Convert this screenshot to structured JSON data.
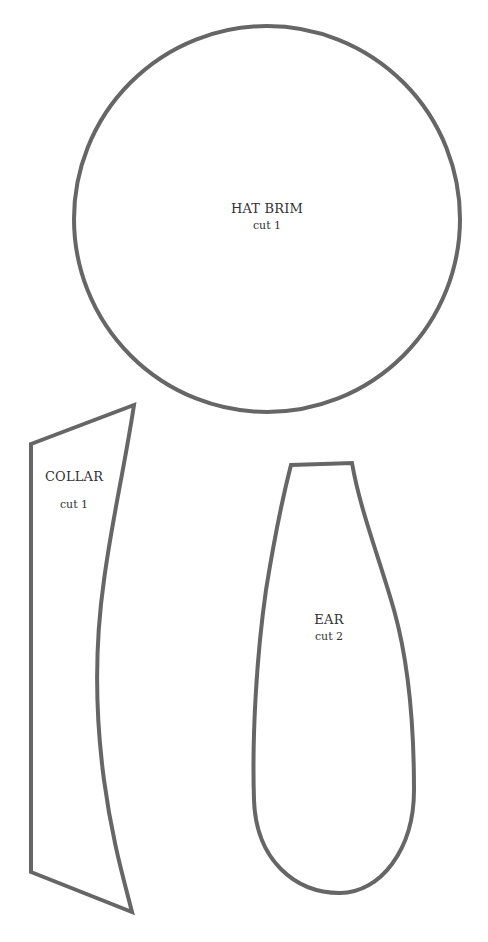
{
  "page": {
    "background": "#ffffff",
    "stroke_color": "#666666"
  },
  "pieces": {
    "hat_brim": {
      "name": "HAT BRIM",
      "cut": "cut 1",
      "shape": "circle"
    },
    "collar": {
      "name": "COLLAR",
      "cut": "cut 1",
      "shape": "quadrilateral-curved"
    },
    "ear": {
      "name": "EAR",
      "cut": "cut 2",
      "shape": "teardrop"
    }
  }
}
